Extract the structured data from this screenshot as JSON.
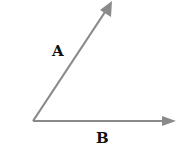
{
  "diagram": {
    "type": "vector-diagram",
    "origin": [
      33,
      121
    ],
    "vectors": [
      {
        "name": "A",
        "label": "A",
        "tip": [
          112,
          1
        ],
        "label_pos": [
          52,
          56
        ]
      },
      {
        "name": "B",
        "label": "B",
        "tip": [
          176,
          121
        ],
        "label_pos": [
          96,
          143
        ]
      }
    ],
    "colors": {
      "arrow": "#8a8a8a",
      "label": "#111111",
      "background": "#ffffff"
    }
  }
}
